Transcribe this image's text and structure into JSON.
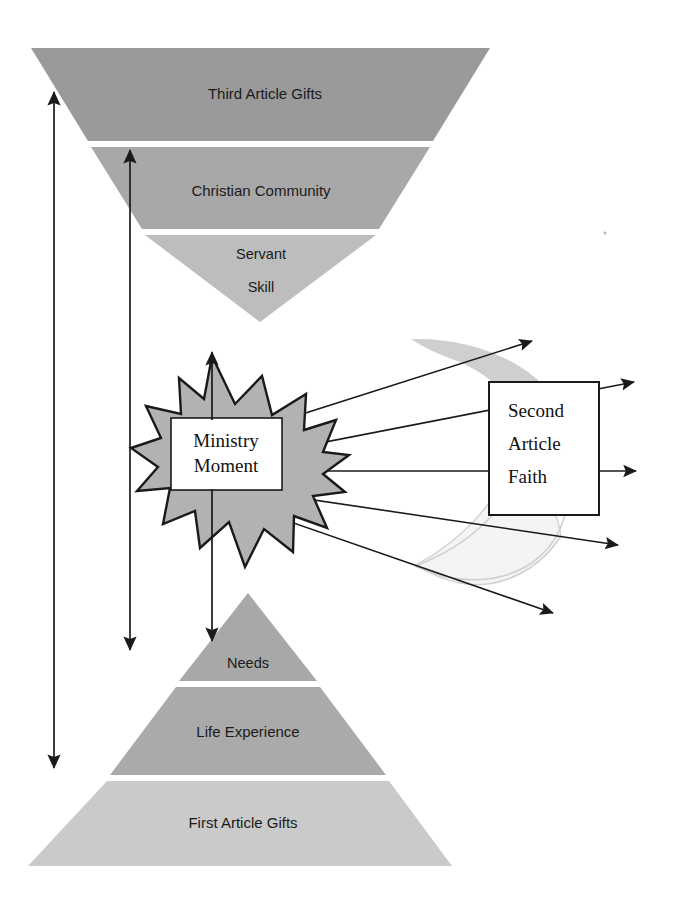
{
  "diagram": {
    "colors": {
      "band_dark": "#9a9a9a",
      "band_mid": "#a8a8a8",
      "band_light": "#c2c2c2",
      "band_lighter": "#cccccc",
      "starburst_fill": "#b0b0b0",
      "starburst_stroke": "#1a1a1a",
      "crescent_upper": "#cfcfcf",
      "crescent_lower": "#f2f2f2",
      "crescent_lower_stroke": "#cfcfcf",
      "arrow": "#1a1a1a",
      "box_fill": "#ffffff",
      "box_stroke": "#1a1a1a",
      "text": "#1a1a1a",
      "background": "#ffffff"
    },
    "inverted_pyramid": {
      "name": "third-article-inverted-pyramid",
      "bands": [
        {
          "label": "Third Article Gifts",
          "shade": "band_dark"
        },
        {
          "label": "Christian Community",
          "shade": "band_mid"
        },
        {
          "label": "Servant",
          "shade": "band_light"
        },
        {
          "label": "Skill",
          "shade": "band_light"
        }
      ]
    },
    "upright_pyramid": {
      "name": "first-article-pyramid",
      "bands": [
        {
          "label": "Needs",
          "shade": "band_mid"
        },
        {
          "label": "Life Experience",
          "shade": "band_mid"
        },
        {
          "label": "First Article Gifts",
          "shade": "band_lighter"
        }
      ]
    },
    "center_node": {
      "name": "ministry-moment",
      "shape": "starburst",
      "line1": "Ministry",
      "line2": "Moment"
    },
    "right_node": {
      "name": "second-article-faith",
      "shape": "rectangle",
      "line1": "Second",
      "line2": "Article",
      "line3": "Faith"
    },
    "arrows": {
      "outer_vertical": {
        "name": "outer-span-arrow",
        "style": "double-headed"
      },
      "inner_vertical": {
        "name": "inner-span-arrow",
        "style": "double-headed"
      },
      "center_vertical": {
        "name": "ministry-moment-span-arrow",
        "style": "double-headed"
      },
      "rays": [
        {
          "name": "ray-1-upper-outward"
        },
        {
          "name": "ray-2-upper-right"
        },
        {
          "name": "ray-3-horizontal"
        },
        {
          "name": "ray-4-lower-right"
        },
        {
          "name": "ray-5-lower-outward"
        }
      ]
    },
    "crescents": [
      {
        "name": "crescent-upper"
      },
      {
        "name": "crescent-lower"
      }
    ]
  }
}
